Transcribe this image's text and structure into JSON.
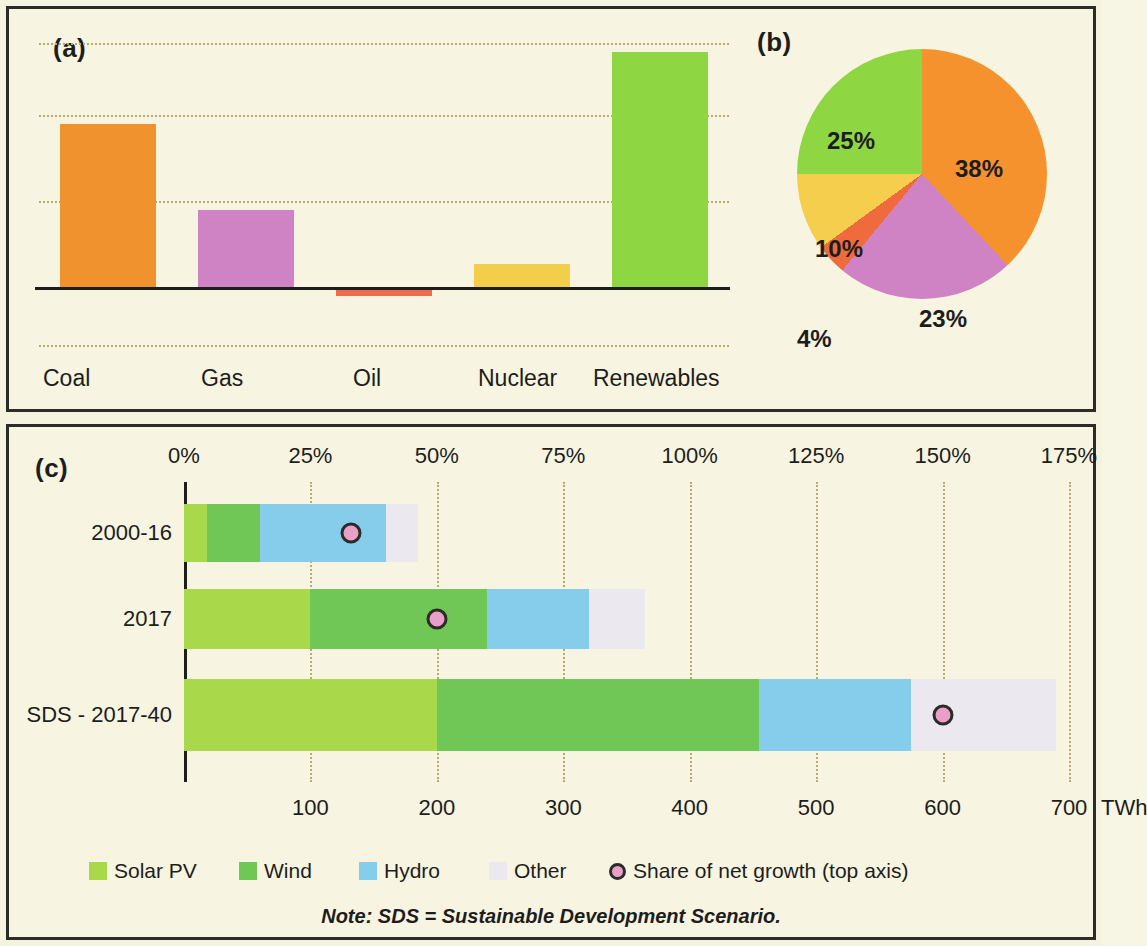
{
  "figure": {
    "background": "#f7f5e2",
    "border_color": "#2b2b28",
    "note": "Note: SDS = Sustainable Development Scenario."
  },
  "panel_a": {
    "tag": "(a)",
    "chart_data": {
      "type": "bar",
      "title": "",
      "xlabel": "",
      "ylabel": "",
      "categories": [
        "Coal",
        "Gas",
        "Oil",
        "Nuclear",
        "Renewables"
      ],
      "values": [
        57,
        27,
        -3,
        8,
        82
      ],
      "ylim": [
        -25,
        90
      ],
      "gridlines": [
        -20,
        0,
        30,
        60,
        85
      ],
      "grid": true,
      "colors": [
        "#f0922e",
        "#cf83c5",
        "#ef6b4e",
        "#f2ce4a",
        "#8fd742"
      ],
      "tick_labels": []
    }
  },
  "panel_b": {
    "tag": "(b)",
    "chart_data": {
      "type": "pie",
      "title": "",
      "labels": [
        "38%",
        "23%",
        "4%",
        "10%",
        "25%"
      ],
      "values": [
        38,
        23,
        4,
        10,
        25
      ],
      "colors": [
        "#f5922e",
        "#cf83c5",
        "#ef6b3e",
        "#f4ce4c",
        "#8fd742"
      ],
      "legend": "none",
      "start_angle_deg": 0
    }
  },
  "panel_c": {
    "tag": "(c)",
    "chart_data": {
      "type": "bar",
      "orientation": "horizontal",
      "stacked": true,
      "title": "",
      "categories": [
        "2000-16",
        "2017",
        "SDS - 2017-40"
      ],
      "series": [
        {
          "name": "Solar PV",
          "color": "#a9d94a",
          "values": [
            18,
            100,
            200
          ]
        },
        {
          "name": "Wind",
          "color": "#70c755",
          "values": [
            42,
            140,
            255
          ]
        },
        {
          "name": "Hydro",
          "color": "#86cdec",
          "values": [
            100,
            80,
            120
          ]
        },
        {
          "name": "Other",
          "color": "#ece8ef",
          "values": [
            25,
            45,
            115
          ]
        }
      ],
      "overlay_series": {
        "name": "Share of net growth (top axis)",
        "marker": "circle",
        "fill": "#e9a0c8",
        "edge": "#2b2b28",
        "values_percent": [
          33,
          50,
          150
        ]
      },
      "bottom_axis": {
        "label": "TWh",
        "ticks": [
          100,
          200,
          300,
          400,
          500,
          600,
          700
        ],
        "tick_labels": [
          "100",
          "200",
          "300",
          "400",
          "500",
          "600",
          "700"
        ],
        "min": 0,
        "max": 700
      },
      "top_axis": {
        "ticks": [
          0,
          25,
          50,
          75,
          100,
          125,
          150,
          175
        ],
        "tick_labels": [
          "0%",
          "25%",
          "50%",
          "75%",
          "100%",
          "125%",
          "150%",
          "175%"
        ],
        "min": 0,
        "max": 175
      },
      "grid": true
    },
    "legend": [
      {
        "label": "Solar PV",
        "color": "#a9d94a",
        "marker": "swatch"
      },
      {
        "label": "Wind",
        "color": "#70c755",
        "marker": "swatch"
      },
      {
        "label": "Hydro",
        "color": "#86cdec",
        "marker": "swatch"
      },
      {
        "label": "Other",
        "color": "#ece8ef",
        "marker": "swatch"
      },
      {
        "label": "Share of net growth (top axis)",
        "color": "#e9a0c8",
        "marker": "dot"
      }
    ]
  }
}
